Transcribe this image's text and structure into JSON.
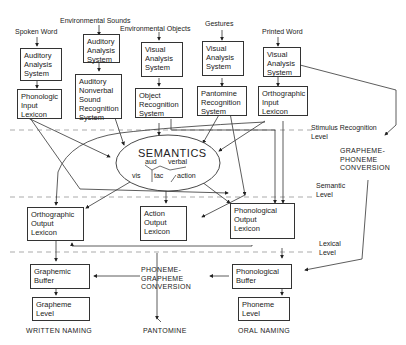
{
  "diagram": {
    "inputs": {
      "spoken_word": "Spoken Word",
      "environmental_sounds": "Environmental Sounds",
      "environmental_objects": "Environmental Objects",
      "gestures": "Gestures",
      "printed_word": "Printed Word"
    },
    "boxes": {
      "auditory_analysis_1": "Auditory\nAnalysis\nSystem",
      "auditory_analysis_2": "Auditory\nAnalysis\nSystem",
      "visual_analysis_1": "Visual\nAnalysis\nSystem",
      "visual_analysis_2": "Visual\nAnalysis\nSystem",
      "visual_analysis_3": "Visual\nAnalysis\nSystem",
      "phonologic_input_lexicon": "Phonologic\nInput\nLexicon",
      "auditory_nonverbal": "Auditory\nNonverbal\nSound\nRecognition\nSystem",
      "object_recognition": "Object\nRecognition\nSystem",
      "pantomime_recognition": "Pantomine\nRecognition\nSystem",
      "orthographic_input_lexicon": "Orthographic\nInput\nLexicon",
      "orthographic_output_lexicon": "Orthographic\nOutput\nLexicon",
      "action_output_lexicon": "Action\nOutput\nLexicon",
      "phonological_output_lexicon": "Phonological\nOutput\nLexicon",
      "graphemic_buffer": "Graphemic\nBuffer",
      "grapheme_level": "Grapheme\nLevel",
      "phonological_buffer": "Phonological\nBuffer",
      "phoneme_level": "Phoneme\nLevel"
    },
    "semantics": {
      "title": "SEMANTICS",
      "aud": "aud",
      "verbal": "verbal",
      "vis": "vis",
      "tac": "tac",
      "action": "action"
    },
    "conversions": {
      "grapheme_phoneme": "GRAPHEME-\nPHONEME\nCONVERSION",
      "phoneme_grapheme": "PHONEME-\nGRAPHEME\nCONVERSION"
    },
    "levels": {
      "stimulus_recognition": "Stimulus Recognition\nLevel",
      "semantic": "Semantic\nLevel",
      "lexical": "Lexical\nLevel"
    },
    "outputs": {
      "written_naming": "WRITTEN NAMING",
      "pantomime": "PANTOMINE",
      "oral_naming": "ORAL NAMING"
    }
  }
}
